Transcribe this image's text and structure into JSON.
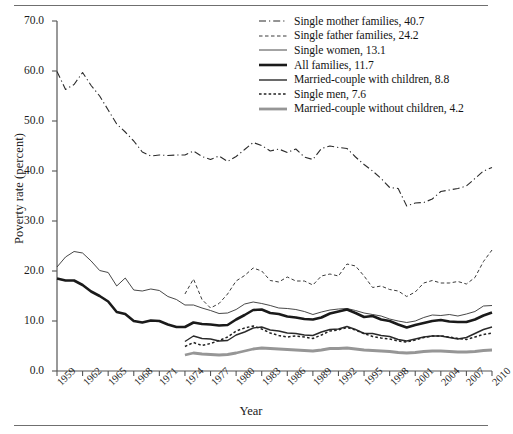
{
  "figure": {
    "ylabel": "Poverty rate (percent)",
    "xlabel": "Year"
  },
  "chart_data": {
    "type": "line",
    "title": "",
    "xlabel": "Year",
    "ylabel": "Poverty rate (percent)",
    "xlim": [
      1959,
      2010
    ],
    "ylim": [
      0.0,
      70.0
    ],
    "yticks": [
      "0.0",
      "10.0",
      "20.0",
      "30.0",
      "40.0",
      "50.0",
      "60.0",
      "70.0"
    ],
    "xticks": [
      "1959",
      "1962",
      "1965",
      "1968",
      "1971",
      "1974",
      "1977",
      "1980",
      "1983",
      "1986",
      "1989",
      "1992",
      "1995",
      "1998",
      "2001",
      "2004",
      "2007",
      "2010"
    ],
    "grid": false,
    "legend_position": "top-right",
    "series": [
      {
        "name": "Single mother families",
        "legend_label": "Single mother families, 40.7",
        "end_value": 40.7,
        "style": "dash-dot",
        "color": "#2b2b2b",
        "width": 1.1,
        "x": [
          1959,
          1960,
          1961,
          1962,
          1963,
          1964,
          1965,
          1966,
          1967,
          1968,
          1969,
          1970,
          1971,
          1972,
          1973,
          1974,
          1975,
          1976,
          1977,
          1978,
          1979,
          1980,
          1981,
          1982,
          1983,
          1984,
          1985,
          1986,
          1987,
          1988,
          1989,
          1990,
          1991,
          1992,
          1993,
          1994,
          1995,
          1996,
          1997,
          1998,
          1999,
          2000,
          2001,
          2002,
          2003,
          2004,
          2005,
          2006,
          2007,
          2008,
          2009,
          2010
        ],
        "values": [
          59.9,
          56.3,
          57.3,
          59.7,
          57.1,
          55.0,
          52.2,
          49.4,
          47.8,
          46.0,
          43.8,
          43.0,
          43.2,
          43.1,
          43.2,
          43.2,
          44.0,
          42.9,
          42.3,
          43.0,
          41.9,
          42.9,
          44.3,
          45.7,
          45.1,
          44.0,
          44.4,
          43.7,
          44.4,
          42.8,
          42.3,
          44.5,
          45.0,
          44.7,
          44.5,
          42.8,
          41.3,
          40.0,
          38.5,
          36.7,
          36.5,
          33.0,
          33.6,
          33.7,
          34.4,
          35.9,
          36.2,
          36.5,
          37.0,
          38.5,
          40.0,
          40.7
        ]
      },
      {
        "name": "Single father families",
        "legend_label": "Single father families, 24.2",
        "end_value": 24.2,
        "style": "dashed",
        "color": "#3a3a3a",
        "width": 1.0,
        "x": [
          1974,
          1975,
          1976,
          1977,
          1978,
          1979,
          1980,
          1981,
          1982,
          1983,
          1984,
          1985,
          1986,
          1987,
          1988,
          1989,
          1990,
          1991,
          1992,
          1993,
          1994,
          1995,
          1996,
          1997,
          1998,
          1999,
          2000,
          2001,
          2002,
          2003,
          2004,
          2005,
          2006,
          2007,
          2008,
          2009,
          2010
        ],
        "values": [
          15.4,
          18.4,
          14.3,
          12.6,
          13.5,
          15.4,
          18.0,
          19.1,
          20.6,
          20.0,
          18.1,
          17.8,
          18.8,
          18.0,
          18.0,
          17.2,
          19.0,
          19.4,
          19.0,
          21.4,
          21.0,
          19.0,
          16.7,
          17.0,
          16.3,
          16.0,
          14.9,
          15.8,
          17.6,
          18.1,
          17.6,
          17.6,
          17.9,
          17.4,
          18.7,
          21.9,
          24.2
        ]
      },
      {
        "name": "Single women",
        "legend_label": "Single women, 13.1",
        "end_value": 13.1,
        "style": "solid",
        "color": "#333333",
        "width": 0.9,
        "x": [
          1959,
          1960,
          1961,
          1962,
          1963,
          1964,
          1965,
          1966,
          1967,
          1968,
          1969,
          1970,
          1971,
          1972,
          1973,
          1974,
          1975,
          1976,
          1977,
          1978,
          1979,
          1980,
          1981,
          1982,
          1983,
          1984,
          1985,
          1986,
          1987,
          1988,
          1989,
          1990,
          1991,
          1992,
          1993,
          1994,
          1995,
          1996,
          1997,
          1998,
          1999,
          2000,
          2001,
          2002,
          2003,
          2004,
          2005,
          2006,
          2007,
          2008,
          2009,
          2010
        ],
        "values": [
          20.8,
          22.8,
          23.9,
          23.6,
          22.0,
          20.1,
          19.7,
          17.0,
          18.6,
          16.2,
          16.0,
          16.4,
          16.1,
          14.9,
          14.3,
          13.2,
          13.2,
          12.6,
          12.1,
          11.5,
          11.6,
          12.3,
          13.4,
          13.8,
          13.5,
          13.1,
          12.6,
          12.5,
          12.3,
          11.9,
          11.3,
          11.8,
          12.2,
          12.4,
          12.5,
          12.1,
          11.6,
          11.3,
          11.0,
          10.4,
          10.0,
          9.7,
          10.0,
          10.7,
          11.2,
          11.1,
          11.3,
          11.0,
          11.4,
          11.9,
          13.0,
          13.1
        ]
      },
      {
        "name": "All families",
        "legend_label": "All families, 11.7",
        "end_value": 11.7,
        "style": "solid",
        "color": "#1a1a1a",
        "width": 2.6,
        "x": [
          1959,
          1960,
          1961,
          1962,
          1963,
          1964,
          1965,
          1966,
          1967,
          1968,
          1969,
          1970,
          1971,
          1972,
          1973,
          1974,
          1975,
          1976,
          1977,
          1978,
          1979,
          1980,
          1981,
          1982,
          1983,
          1984,
          1985,
          1986,
          1987,
          1988,
          1989,
          1990,
          1991,
          1992,
          1993,
          1994,
          1995,
          1996,
          1997,
          1998,
          1999,
          2000,
          2001,
          2002,
          2003,
          2004,
          2005,
          2006,
          2007,
          2008,
          2009,
          2010
        ],
        "values": [
          18.5,
          18.1,
          18.1,
          17.2,
          15.9,
          15.0,
          13.9,
          11.8,
          11.4,
          10.0,
          9.7,
          10.1,
          10.0,
          9.3,
          8.8,
          8.8,
          9.7,
          9.4,
          9.3,
          9.1,
          9.2,
          10.3,
          11.2,
          12.2,
          12.3,
          11.6,
          11.4,
          10.9,
          10.7,
          10.4,
          10.3,
          10.7,
          11.5,
          11.9,
          12.3,
          11.6,
          10.8,
          11.0,
          10.3,
          10.0,
          9.3,
          8.7,
          9.2,
          9.6,
          10.0,
          10.2,
          9.9,
          9.8,
          9.8,
          10.3,
          11.1,
          11.7
        ]
      },
      {
        "name": "Married-couple with children",
        "legend_label": "Married-couple with children, 8.8",
        "end_value": 8.8,
        "style": "solid",
        "color": "#2a2a2a",
        "width": 1.4,
        "x": [
          1974,
          1975,
          1976,
          1977,
          1978,
          1979,
          1980,
          1981,
          1982,
          1983,
          1984,
          1985,
          1986,
          1987,
          1988,
          1989,
          1990,
          1991,
          1992,
          1993,
          1994,
          1995,
          1996,
          1997,
          1998,
          1999,
          2000,
          2001,
          2002,
          2003,
          2004,
          2005,
          2006,
          2007,
          2008,
          2009,
          2010
        ],
        "values": [
          5.9,
          7.0,
          6.5,
          6.4,
          6.0,
          6.1,
          7.2,
          7.8,
          8.6,
          8.8,
          8.2,
          8.0,
          7.6,
          7.5,
          7.2,
          7.1,
          7.8,
          8.3,
          8.4,
          8.9,
          8.3,
          7.5,
          7.5,
          7.1,
          6.9,
          6.3,
          6.0,
          6.4,
          6.8,
          7.0,
          7.0,
          6.7,
          6.4,
          6.7,
          7.5,
          8.3,
          8.8
        ]
      },
      {
        "name": "Single men",
        "legend_label": "Single men, 7.6",
        "end_value": 7.6,
        "style": "dotted-dashed",
        "color": "#222222",
        "width": 1.5,
        "x": [
          1974,
          1975,
          1976,
          1977,
          1978,
          1979,
          1980,
          1981,
          1982,
          1983,
          1984,
          1985,
          1986,
          1987,
          1988,
          1989,
          1990,
          1991,
          1992,
          1993,
          1994,
          1995,
          1996,
          1997,
          1998,
          1999,
          2000,
          2001,
          2002,
          2003,
          2004,
          2005,
          2006,
          2007,
          2008,
          2009,
          2010
        ],
        "values": [
          4.9,
          5.7,
          5.1,
          5.5,
          6.1,
          6.8,
          8.0,
          8.6,
          9.0,
          8.4,
          7.6,
          7.1,
          6.8,
          7.0,
          6.8,
          6.5,
          7.2,
          8.0,
          8.2,
          8.7,
          8.2,
          7.5,
          6.9,
          6.6,
          6.4,
          6.0,
          5.8,
          6.2,
          6.7,
          7.0,
          7.0,
          6.8,
          6.5,
          6.3,
          6.8,
          7.3,
          7.6
        ]
      },
      {
        "name": "Married-couple without children",
        "legend_label": "Married-couple without children, 4.2",
        "end_value": 4.2,
        "style": "solid",
        "color": "#969696",
        "width": 2.8,
        "x": [
          1974,
          1975,
          1976,
          1977,
          1978,
          1979,
          1980,
          1981,
          1982,
          1983,
          1984,
          1985,
          1986,
          1987,
          1988,
          1989,
          1990,
          1991,
          1992,
          1993,
          1994,
          1995,
          1996,
          1997,
          1998,
          1999,
          2000,
          2001,
          2002,
          2003,
          2004,
          2005,
          2006,
          2007,
          2008,
          2009,
          2010
        ],
        "values": [
          3.2,
          3.6,
          3.4,
          3.3,
          3.2,
          3.3,
          3.6,
          4.0,
          4.4,
          4.6,
          4.5,
          4.4,
          4.3,
          4.2,
          4.1,
          4.0,
          4.2,
          4.5,
          4.5,
          4.6,
          4.4,
          4.2,
          4.1,
          4.0,
          3.9,
          3.7,
          3.6,
          3.7,
          3.9,
          4.0,
          4.0,
          3.9,
          3.8,
          3.8,
          3.9,
          4.1,
          4.2
        ]
      }
    ]
  }
}
